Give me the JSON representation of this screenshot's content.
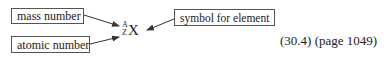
{
  "diagram": {
    "labels": {
      "mass_number": "mass number",
      "atomic_number": "atomic number",
      "symbol": "symbol for element"
    },
    "notation": {
      "mass_superscript": "A",
      "atomic_subscript": "Z",
      "symbol": "X"
    },
    "reference": "(30.4) (page 1049)"
  },
  "colors": {
    "border": "#555555",
    "text": "#222222",
    "arrow": "#333333"
  }
}
